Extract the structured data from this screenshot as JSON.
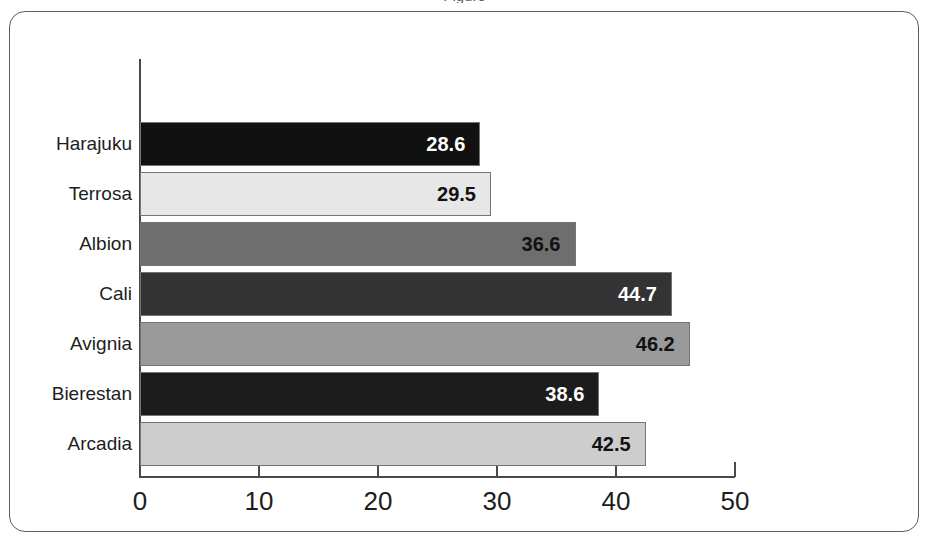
{
  "caption_fragment": "Figure",
  "chart_data": {
    "type": "bar",
    "orientation": "horizontal",
    "title": "",
    "subtitle": "",
    "xlabel": "",
    "ylabel": "",
    "xlim": [
      0,
      50
    ],
    "xticks": [
      0,
      10,
      20,
      30,
      40,
      50
    ],
    "xtick_labels": [
      "0",
      "10",
      "20",
      "30",
      "40",
      "50"
    ],
    "grid": false,
    "legend": false,
    "legend_position": "none",
    "categories": [
      "Harajuku",
      "Terrosa",
      "Albion",
      "Cali",
      "Avignia",
      "Bierestan",
      "Arcadia"
    ],
    "values": [
      28.6,
      29.5,
      36.6,
      44.7,
      46.2,
      38.6,
      42.5
    ],
    "value_labels": [
      "28.6",
      "29.5",
      "36.6",
      "44.7",
      "46.2",
      "38.6",
      "42.5"
    ],
    "bar_colors": [
      "#111111",
      "#e7e7e7",
      "#6e6e6e",
      "#333333",
      "#9a9a9a",
      "#1c1c1c",
      "#cdcdcd"
    ],
    "value_label_colors": [
      "#ffffff",
      "#111111",
      "#111111",
      "#ffffff",
      "#111111",
      "#ffffff",
      "#111111"
    ],
    "bars": [
      {
        "category": "Harajuku",
        "value": 28.6,
        "label": "28.6",
        "color": "#111111",
        "label_color": "#ffffff"
      },
      {
        "category": "Terrosa",
        "value": 29.5,
        "label": "29.5",
        "color": "#e7e7e7",
        "label_color": "#111111"
      },
      {
        "category": "Albion",
        "value": 36.6,
        "label": "36.6",
        "color": "#6e6e6e",
        "label_color": "#111111"
      },
      {
        "category": "Cali",
        "value": 44.7,
        "label": "44.7",
        "color": "#333333",
        "label_color": "#ffffff"
      },
      {
        "category": "Avignia",
        "value": 46.2,
        "label": "46.2",
        "color": "#9a9a9a",
        "label_color": "#111111"
      },
      {
        "category": "Bierestan",
        "value": 38.6,
        "label": "38.6",
        "color": "#1c1c1c",
        "label_color": "#ffffff"
      },
      {
        "category": "Arcadia",
        "value": 42.5,
        "label": "42.5",
        "color": "#cdcdcd",
        "label_color": "#111111"
      }
    ]
  }
}
